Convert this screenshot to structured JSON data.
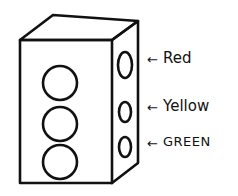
{
  "diagram": {
    "type": "hand-drawn traffic light box",
    "stroke_color": "#111111",
    "background": "#ffffff",
    "labels": [
      {
        "id": "red",
        "text": "Red",
        "arrow": "←"
      },
      {
        "id": "yellow",
        "text": "Yellow",
        "arrow": "←"
      },
      {
        "id": "green",
        "text": "Green",
        "arrow": "←"
      }
    ],
    "front_lights_count": 3,
    "side_lights_count": 3
  }
}
